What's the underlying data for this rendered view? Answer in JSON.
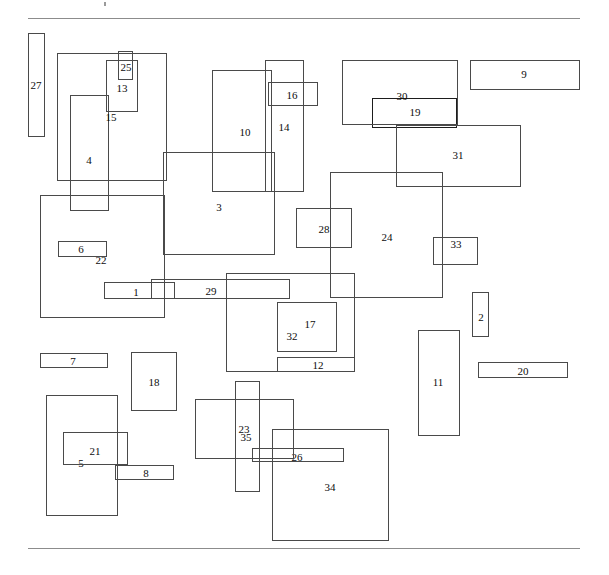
{
  "figure": {
    "width": 609,
    "height": 575,
    "background": "#ffffff",
    "line_color": "#4a4a4a",
    "rule_color": "#8c8c8c",
    "label_color": "#0d0d0d",
    "top_rule": {
      "x": 28,
      "y": 18,
      "w": 552
    },
    "bottom_rule": {
      "x": 28,
      "y": 548,
      "w": 552
    },
    "speck": {
      "x": 104,
      "y": 2
    }
  },
  "chart_data": {
    "type": "diagram",
    "title": "",
    "xlabel": "",
    "ylabel": "",
    "count": 35,
    "units": "pixels",
    "xlim": [
      0,
      609
    ],
    "ylim": [
      0,
      575
    ],
    "grid": false,
    "legend": "none",
    "rectangles": [
      {
        "id": "1",
        "x": 104,
        "y": 282,
        "w": 71,
        "h": 17,
        "bold": false,
        "lx": 136,
        "ly": 292
      },
      {
        "id": "2",
        "x": 472,
        "y": 292,
        "w": 17,
        "h": 45,
        "bold": false,
        "lx": 481,
        "ly": 317
      },
      {
        "id": "3",
        "x": 163,
        "y": 152,
        "w": 112,
        "h": 103,
        "bold": false,
        "lx": 219,
        "ly": 207
      },
      {
        "id": "4",
        "x": 70,
        "y": 95,
        "w": 39,
        "h": 116,
        "bold": false,
        "lx": 89,
        "ly": 160
      },
      {
        "id": "5",
        "x": 46,
        "y": 395,
        "w": 72,
        "h": 121,
        "bold": false,
        "lx": 81,
        "ly": 463
      },
      {
        "id": "6",
        "x": 58,
        "y": 241,
        "w": 49,
        "h": 16,
        "bold": false,
        "lx": 81,
        "ly": 249
      },
      {
        "id": "7",
        "x": 40,
        "y": 353,
        "w": 68,
        "h": 15,
        "bold": false,
        "lx": 73,
        "ly": 361
      },
      {
        "id": "8",
        "x": 115,
        "y": 465,
        "w": 59,
        "h": 15,
        "bold": false,
        "lx": 146,
        "ly": 473
      },
      {
        "id": "9",
        "x": 470,
        "y": 60,
        "w": 110,
        "h": 30,
        "bold": false,
        "lx": 524,
        "ly": 74
      },
      {
        "id": "10",
        "x": 212,
        "y": 70,
        "w": 60,
        "h": 122,
        "bold": false,
        "lx": 245,
        "ly": 132
      },
      {
        "id": "11",
        "x": 418,
        "y": 330,
        "w": 42,
        "h": 106,
        "bold": false,
        "lx": 438,
        "ly": 382
      },
      {
        "id": "12",
        "x": 277,
        "y": 357,
        "w": 78,
        "h": 15,
        "bold": false,
        "lx": 318,
        "ly": 365
      },
      {
        "id": "13",
        "x": 106,
        "y": 60,
        "w": 32,
        "h": 52,
        "bold": false,
        "lx": 122,
        "ly": 88
      },
      {
        "id": "14",
        "x": 265,
        "y": 60,
        "w": 39,
        "h": 132,
        "bold": false,
        "lx": 284,
        "ly": 127
      },
      {
        "id": "15",
        "x": 57,
        "y": 53,
        "w": 110,
        "h": 128,
        "bold": false,
        "lx": 111,
        "ly": 117
      },
      {
        "id": "16",
        "x": 268,
        "y": 82,
        "w": 50,
        "h": 24,
        "bold": false,
        "lx": 292,
        "ly": 95
      },
      {
        "id": "17",
        "x": 226,
        "y": 273,
        "w": 129,
        "h": 99,
        "bold": false,
        "lx": 310,
        "ly": 324
      },
      {
        "id": "18",
        "x": 131,
        "y": 352,
        "w": 46,
        "h": 59,
        "bold": false,
        "lx": 154,
        "ly": 382
      },
      {
        "id": "19",
        "x": 372,
        "y": 98,
        "w": 85,
        "h": 30,
        "bold": true,
        "lx": 415,
        "ly": 112
      },
      {
        "id": "20",
        "x": 478,
        "y": 362,
        "w": 90,
        "h": 16,
        "bold": false,
        "lx": 523,
        "ly": 371
      },
      {
        "id": "21",
        "x": 63,
        "y": 432,
        "w": 65,
        "h": 33,
        "bold": false,
        "lx": 95,
        "ly": 451
      },
      {
        "id": "22",
        "x": 40,
        "y": 195,
        "w": 125,
        "h": 123,
        "bold": false,
        "lx": 101,
        "ly": 260
      },
      {
        "id": "23",
        "x": 235,
        "y": 381,
        "w": 25,
        "h": 111,
        "bold": false,
        "lx": 244,
        "ly": 429
      },
      {
        "id": "24",
        "x": 330,
        "y": 172,
        "w": 113,
        "h": 126,
        "bold": false,
        "lx": 387,
        "ly": 237
      },
      {
        "id": "25",
        "x": 118,
        "y": 51,
        "w": 15,
        "h": 29,
        "bold": false,
        "lx": 126,
        "ly": 67
      },
      {
        "id": "26",
        "x": 252,
        "y": 448,
        "w": 92,
        "h": 14,
        "bold": false,
        "lx": 297,
        "ly": 457
      },
      {
        "id": "27",
        "x": 28,
        "y": 33,
        "w": 17,
        "h": 104,
        "bold": false,
        "lx": 36,
        "ly": 85
      },
      {
        "id": "28",
        "x": 296,
        "y": 208,
        "w": 56,
        "h": 40,
        "bold": false,
        "lx": 324,
        "ly": 229
      },
      {
        "id": "29",
        "x": 151,
        "y": 279,
        "w": 139,
        "h": 20,
        "bold": false,
        "lx": 211,
        "ly": 291
      },
      {
        "id": "30",
        "x": 342,
        "y": 60,
        "w": 116,
        "h": 65,
        "bold": false,
        "lx": 402,
        "ly": 96
      },
      {
        "id": "31",
        "x": 396,
        "y": 125,
        "w": 125,
        "h": 62,
        "bold": false,
        "lx": 458,
        "ly": 155
      },
      {
        "id": "32",
        "x": 277,
        "y": 302,
        "w": 60,
        "h": 50,
        "bold": false,
        "lx": 292,
        "ly": 336
      },
      {
        "id": "33",
        "x": 433,
        "y": 237,
        "w": 45,
        "h": 28,
        "bold": false,
        "lx": 456,
        "ly": 244
      },
      {
        "id": "34",
        "x": 272,
        "y": 429,
        "w": 117,
        "h": 112,
        "bold": false,
        "lx": 330,
        "ly": 487
      },
      {
        "id": "35",
        "x": 195,
        "y": 399,
        "w": 99,
        "h": 60,
        "bold": false,
        "lx": 246,
        "ly": 437
      }
    ]
  }
}
